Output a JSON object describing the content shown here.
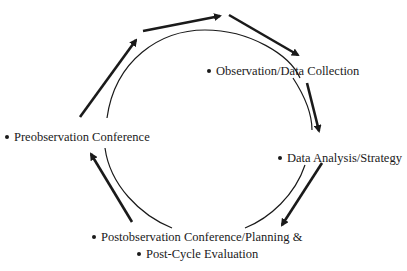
{
  "diagram": {
    "type": "cycle",
    "stages": [
      {
        "id": "observation",
        "label": "Observation/Data Collection"
      },
      {
        "id": "analysis",
        "label": "Data Analysis/Strategy"
      },
      {
        "id": "postobservation",
        "label": "Postobservation Conference/Planning &"
      },
      {
        "id": "evaluation",
        "label": "Post-Cycle Evaluation"
      },
      {
        "id": "preobservation",
        "label": "Preobservation Conference"
      }
    ],
    "flow_direction": "clockwise",
    "colors": {
      "ink": "#1a1a1a",
      "background": "#ffffff"
    }
  }
}
